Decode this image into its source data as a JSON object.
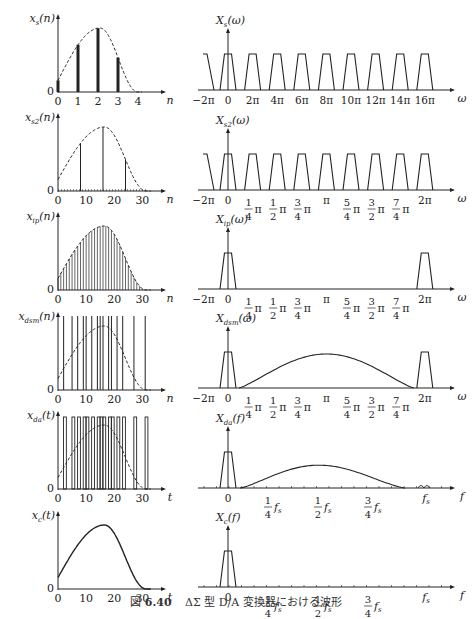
{
  "caption": {
    "prefix": "図",
    "number": "6.40",
    "text": "ΔΣ 型 D/A 変換器における波形"
  },
  "colors": {
    "ink": "#222222",
    "background": "#ffffff"
  },
  "chart_data": [
    {
      "id": "xs",
      "type": "stem",
      "ylabel": "x_s(n)",
      "xlabel": "n",
      "xticks": [
        "0",
        "1",
        "2",
        "3",
        "4"
      ],
      "xrange": [
        0,
        4.5
      ],
      "y_zero_label": "0",
      "envelope": "dashed",
      "stems": [
        {
          "x": 0,
          "y": 0.18
        },
        {
          "x": 1,
          "y": 0.72
        },
        {
          "x": 2,
          "y": 1.0
        },
        {
          "x": 3,
          "y": 0.32
        }
      ],
      "stem_style": "thick"
    },
    {
      "id": "Xs",
      "type": "spectrum",
      "ylabel": "X_s(ω)",
      "xlabel": "ω",
      "xticks": [
        "−2π",
        "0",
        "2π",
        "4π",
        "6π",
        "8π",
        "10π",
        "12π",
        "14π",
        "16π"
      ],
      "shape": "periodic trapezoids at every multiple of 2π"
    },
    {
      "id": "xs2",
      "type": "stem",
      "ylabel": "x_s2(n)",
      "xlabel": "n",
      "xticks": [
        "0",
        "10",
        "20",
        "30"
      ],
      "xrange": [
        0,
        32
      ],
      "y_zero_label": "0",
      "envelope": "dashed",
      "stems": [
        {
          "x": 0,
          "y": 0.18
        },
        {
          "x": 8,
          "y": 0.78
        },
        {
          "x": 16,
          "y": 1.0
        },
        {
          "x": 24,
          "y": 0.32
        }
      ],
      "zero_stems_between": true
    },
    {
      "id": "Xs2",
      "type": "spectrum",
      "ylabel": "X_s2(ω)",
      "xlabel": "ω",
      "xticks": [
        "−2π",
        "0",
        "1/4 π",
        "1/2 π",
        "3/4 π",
        "π",
        "5/4 π",
        "3/2 π",
        "7/4 π",
        "2π"
      ],
      "shape": "trapezoids repeated every π/4"
    },
    {
      "id": "xip",
      "type": "stem",
      "ylabel": "x_ip(n)",
      "xlabel": "n",
      "xticks": [
        "0",
        "10",
        "20",
        "30"
      ],
      "xrange": [
        0,
        32
      ],
      "y_zero_label": "0",
      "envelope": "dashed",
      "stems": "every integer n on envelope"
    },
    {
      "id": "Xip",
      "type": "spectrum",
      "ylabel": "X_ip(ω)",
      "xlabel": "ω",
      "xticks": [
        "−2π",
        "0",
        "1/4 π",
        "1/2 π",
        "3/4 π",
        "π",
        "5/4 π",
        "3/2 π",
        "7/4 π",
        "2π"
      ],
      "shape": "trapezoids at 0 and 2π only"
    },
    {
      "id": "xdsm",
      "type": "stem",
      "ylabel": "x_dsm(n)",
      "xlabel": "n",
      "xticks": [
        "0",
        "10",
        "20",
        "30"
      ],
      "xrange": [
        0,
        32
      ],
      "y_zero_label": "0",
      "envelope": "dashed",
      "pulse_positions": [
        2,
        5,
        7,
        9,
        10,
        12,
        14,
        15,
        16,
        18,
        19,
        21,
        23,
        27,
        31
      ]
    },
    {
      "id": "Xdsm",
      "type": "spectrum",
      "ylabel": "X_dsm(ω)",
      "xlabel": "ω",
      "xticks": [
        "−2π",
        "0",
        "1/4 π",
        "1/2 π",
        "3/4 π",
        "π",
        "5/4 π",
        "3/2 π",
        "7/4 π",
        "2π"
      ],
      "shape": "trapezoids at 0 and 2π plus shaped noise hump peaking at π"
    },
    {
      "id": "xda",
      "type": "pulse",
      "ylabel": "x_da(t)",
      "xlabel": "t",
      "xticks": [
        "0",
        "10",
        "20",
        "30"
      ],
      "xrange": [
        0,
        32
      ],
      "y_zero_label": "0",
      "envelope": "dashed",
      "pulse_positions": [
        2,
        5,
        7,
        9,
        10,
        12,
        14,
        15,
        16,
        18,
        19,
        21,
        23,
        27,
        31
      ]
    },
    {
      "id": "Xda",
      "type": "spectrum",
      "ylabel": "X_da(f)",
      "xlabel": "f",
      "xticks": [
        "0",
        "1/4 f_s",
        "1/2 f_s",
        "3/4 f_s",
        "f_s"
      ],
      "shape": "baseband trapezoid, sinc-shaped noise hump peaking near 0.45 f_s, small ripples near f_s"
    },
    {
      "id": "xc",
      "type": "line",
      "ylabel": "x_c(t)",
      "xlabel": "t",
      "xticks": [
        "0",
        "10",
        "20",
        "30"
      ],
      "xrange": [
        0,
        32
      ],
      "y_zero_label": "0",
      "envelope": "solid"
    },
    {
      "id": "Xc",
      "type": "spectrum",
      "ylabel": "X_c(f)",
      "xlabel": "f",
      "xticks": [
        "0",
        "1/4 f_s",
        "1/2 f_s",
        "3/4 f_s",
        "f_s"
      ],
      "shape": "baseband trapezoid only"
    }
  ]
}
